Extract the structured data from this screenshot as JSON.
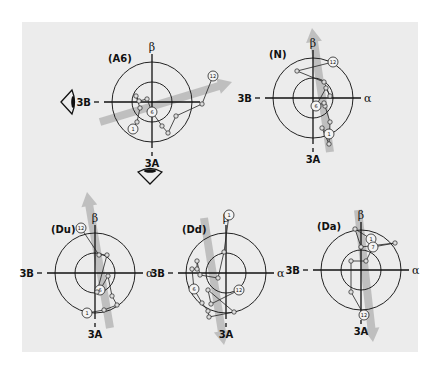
{
  "figure": {
    "background": "#ececec",
    "panels": [
      {
        "id": "A6",
        "label": "(A6)",
        "center": [
          152,
          102
        ],
        "axes": {
          "top": "β",
          "left": "3B",
          "bottom": "3A",
          "right": ""
        },
        "arrow": {
          "from": [
            100,
            122
          ],
          "to": [
            232,
            82
          ],
          "direction": "horizontal-oblique"
        },
        "start_marker": "1",
        "mid_marker": "6",
        "end_marker": "12",
        "path": [
          [
            133,
            129
          ],
          [
            137,
            122
          ],
          [
            140,
            108
          ],
          [
            136,
            96
          ],
          [
            139,
            101
          ],
          [
            147,
            99
          ],
          [
            152,
            112
          ],
          [
            162,
            126
          ],
          [
            168,
            133
          ],
          [
            176,
            116
          ],
          [
            202,
            104
          ],
          [
            213,
            76
          ]
        ]
      },
      {
        "id": "N",
        "label": "(N)",
        "center": [
          313,
          98
        ],
        "axes": {
          "top": "β",
          "left": "3B",
          "bottom": "3A",
          "right": "α"
        },
        "arrow": {
          "from": [
            330,
            152
          ],
          "to": [
            312,
            28
          ],
          "direction": "upward"
        },
        "start_marker": "1",
        "mid_marker": "6",
        "end_marker": "12",
        "path": [
          [
            329,
            134
          ],
          [
            322,
            128
          ],
          [
            329,
            144
          ],
          [
            330,
            122
          ],
          [
            325,
            106
          ],
          [
            324,
            103
          ],
          [
            316,
            106
          ],
          [
            326,
            88
          ],
          [
            330,
            96
          ],
          [
            324,
            82
          ],
          [
            297,
            71
          ],
          [
            333,
            62
          ]
        ]
      },
      {
        "id": "Du",
        "label": "(Du)",
        "center": [
          95,
          273
        ],
        "axes": {
          "top": "β",
          "left": "3B",
          "bottom": "3A",
          "right": "α"
        },
        "arrow": {
          "from": [
            110,
            328
          ],
          "to": [
            87,
            192
          ],
          "direction": "upward"
        },
        "start_marker": "1",
        "mid_marker": "6",
        "end_marker": "12",
        "path": [
          [
            87,
            313
          ],
          [
            104,
            310
          ],
          [
            117,
            305
          ],
          [
            112,
            296
          ],
          [
            108,
            276
          ],
          [
            100,
            290
          ],
          [
            97,
            292
          ],
          [
            107,
            255
          ],
          [
            99,
            255
          ],
          [
            81,
            228
          ]
        ]
      },
      {
        "id": "Dd",
        "label": "(Dd)",
        "center": [
          226,
          273
        ],
        "axes": {
          "top": "β",
          "left": "3B",
          "bottom": "3A",
          "right": "α"
        },
        "arrow": {
          "from": [
            204,
            218
          ],
          "to": [
            224,
            345
          ],
          "direction": "downward"
        },
        "start_marker": "1",
        "mid_marker": "6",
        "end_marker": "12",
        "path": [
          [
            229,
            215
          ],
          [
            224,
            252
          ],
          [
            218,
            278
          ],
          [
            200,
            275
          ],
          [
            197,
            261
          ],
          [
            197,
            269
          ],
          [
            192,
            269
          ],
          [
            194,
            289
          ],
          [
            202,
            303
          ],
          [
            208,
            311
          ],
          [
            209,
            317
          ],
          [
            234,
            312
          ],
          [
            208,
            290
          ],
          [
            211,
            304
          ],
          [
            239,
            290
          ]
        ]
      },
      {
        "id": "Da",
        "label": "(Da)",
        "center": [
          361,
          270
        ],
        "axes": {
          "top": "β",
          "left": "3B",
          "bottom": "3A",
          "right": "α"
        },
        "arrow": {
          "from": [
            358,
            210
          ],
          "to": [
            373,
            342
          ],
          "direction": "downward"
        },
        "start_marker": "1",
        "mid_marker": "7",
        "end_marker": "12",
        "path": [
          [
            371,
            239
          ],
          [
            355,
            229
          ],
          [
            361,
            247
          ],
          [
            395,
            243
          ],
          [
            373,
            247
          ],
          [
            366,
            261
          ],
          [
            351,
            261
          ],
          [
            351,
            292
          ],
          [
            364,
            315
          ]
        ]
      }
    ],
    "eye_icons": [
      {
        "name": "eye-left-icon",
        "position": [
          70,
          102
        ],
        "facing": "right"
      },
      {
        "name": "eye-below-icon",
        "position": [
          150,
          175
        ],
        "facing": "up"
      }
    ]
  }
}
